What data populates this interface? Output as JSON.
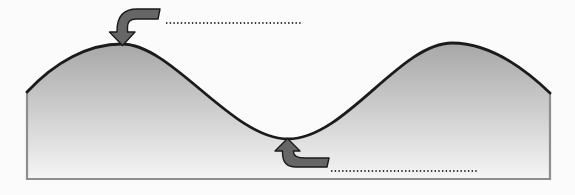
{
  "figure": {
    "type": "wave-diagram",
    "annotations": [
      {
        "target": "first-crest",
        "icon": "curved-arrow-down",
        "label_text": "",
        "label_style": "dotted-blank-line"
      },
      {
        "target": "trough",
        "icon": "curved-arrow-up",
        "label_text": "",
        "label_style": "dotted-blank-line"
      }
    ],
    "colors": {
      "background": "#fbfbfb",
      "fill_top": "#a7a7a7",
      "fill_bottom": "#f6f6f6",
      "curve_stroke": "#1b1b1b",
      "border_stroke": "#8e8e8e",
      "arrow_fill": "#666666",
      "arrow_stroke": "#1b1b1b",
      "dotted_line_color": "#3a3a3a"
    }
  }
}
